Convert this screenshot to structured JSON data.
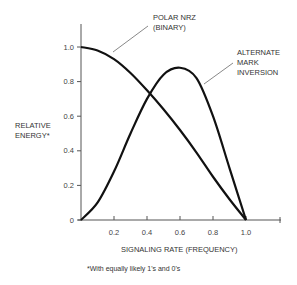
{
  "chart_data": {
    "type": "line",
    "title": "",
    "xlabel": "SIGNALING RATE (FREQUENCY)",
    "ylabel": [
      "RELATIVE",
      "ENERGY*"
    ],
    "xlim": [
      0,
      1.2
    ],
    "ylim": [
      0,
      1.1
    ],
    "x_ticks": [
      "0.2",
      "0.4",
      "0.6",
      "0.8",
      "1.0"
    ],
    "y_ticks": [
      "0",
      "0.2",
      "0.4",
      "0.6",
      "0.8",
      "1.0"
    ],
    "grid": false,
    "legend": "inline annotations",
    "series": [
      {
        "name": "POLAR NRZ (BINARY)",
        "label_lines": [
          "POLAR NRZ",
          "(BINARY)"
        ],
        "x": [
          0,
          0.1,
          0.2,
          0.3,
          0.4,
          0.5,
          0.6,
          0.7,
          0.8,
          0.9,
          1.0
        ],
        "y": [
          1.0,
          0.98,
          0.93,
          0.85,
          0.75,
          0.64,
          0.52,
          0.39,
          0.25,
          0.12,
          0
        ]
      },
      {
        "name": "ALTERNATE MARK INVERSION",
        "label_lines": [
          "ALTERNATE",
          "MARK",
          "INVERSION"
        ],
        "x": [
          0,
          0.1,
          0.2,
          0.3,
          0.4,
          0.5,
          0.6,
          0.7,
          0.8,
          0.9,
          1.0
        ],
        "y": [
          0,
          0.1,
          0.28,
          0.5,
          0.7,
          0.84,
          0.88,
          0.82,
          0.6,
          0.3,
          0
        ]
      }
    ],
    "footnote": "*With equally likely 1's and 0's"
  }
}
